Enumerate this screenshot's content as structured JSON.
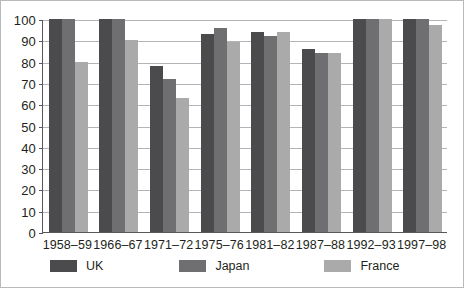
{
  "chart_data": {
    "type": "bar",
    "title": "",
    "subtitle": "",
    "xlabel": "",
    "ylabel": "",
    "ylim": [
      0,
      100
    ],
    "yticks": [
      0,
      10,
      20,
      30,
      40,
      50,
      60,
      70,
      80,
      90,
      100
    ],
    "grid": true,
    "legend_position": "bottom",
    "categories": [
      "1958–59",
      "1966–67",
      "1971–72",
      "1975–76",
      "1981–82",
      "1987–88",
      "1992–93",
      "1997–98"
    ],
    "series": [
      {
        "name": "UK",
        "color": "#4b4a4d",
        "values": [
          100,
          100,
          78,
          93,
          94,
          86,
          100,
          100
        ]
      },
      {
        "name": "Japan",
        "color": "#6f6e71",
        "values": [
          100,
          100,
          72,
          96,
          92,
          84,
          100,
          100
        ]
      },
      {
        "name": "France",
        "color": "#aaaaab",
        "values": [
          80,
          90,
          63,
          89,
          94,
          84,
          100,
          97
        ]
      }
    ]
  },
  "legend": {
    "items": [
      {
        "label": "UK"
      },
      {
        "label": "Japan"
      },
      {
        "label": "France"
      }
    ]
  }
}
